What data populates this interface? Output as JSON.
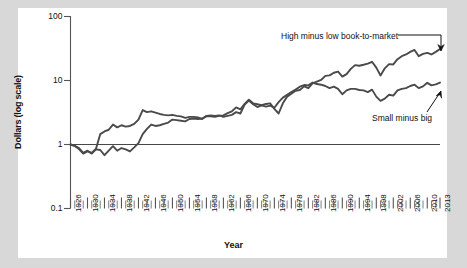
{
  "chart_data": {
    "type": "line",
    "title": "",
    "xlabel": "Year",
    "ylabel": "Dollars (log scale)",
    "log_y": true,
    "ylim": [
      0.1,
      100
    ],
    "ytick_labels": [
      "100",
      "10",
      "1",
      "0.1"
    ],
    "ytick_values": [
      100,
      10,
      1,
      0.1
    ],
    "xlim": [
      1926,
      2013
    ],
    "grid": false,
    "legend_position": "inline-annotations",
    "reference_line_y": 1,
    "xtick_labels": [
      "1926",
      "1930",
      "1934",
      "1938",
      "1942",
      "1946",
      "1950",
      "1954",
      "1958",
      "1962",
      "1966",
      "1970",
      "1974",
      "1978",
      "1982",
      "1986",
      "1990",
      "1994",
      "1998",
      "2002",
      "2006",
      "2010",
      "2013"
    ],
    "xtick_values": [
      1926,
      1930,
      1934,
      1938,
      1942,
      1946,
      1950,
      1954,
      1958,
      1962,
      1966,
      1970,
      1974,
      1978,
      1982,
      1986,
      1990,
      1994,
      1998,
      2002,
      2006,
      2010,
      2013
    ],
    "minor_tick_interval": 1,
    "series": [
      {
        "name": "High minus low book-to-market",
        "color": "#4a4a4a",
        "x": [
          1926,
          1927,
          1928,
          1929,
          1930,
          1931,
          1932,
          1933,
          1934,
          1935,
          1936,
          1937,
          1938,
          1939,
          1940,
          1941,
          1942,
          1943,
          1944,
          1945,
          1946,
          1947,
          1948,
          1949,
          1950,
          1951,
          1952,
          1953,
          1954,
          1955,
          1956,
          1957,
          1958,
          1959,
          1960,
          1961,
          1962,
          1963,
          1964,
          1965,
          1966,
          1967,
          1968,
          1969,
          1970,
          1971,
          1972,
          1973,
          1974,
          1975,
          1976,
          1977,
          1978,
          1979,
          1980,
          1981,
          1982,
          1983,
          1984,
          1985,
          1986,
          1987,
          1988,
          1989,
          1990,
          1991,
          1992,
          1993,
          1994,
          1995,
          1996,
          1997,
          1998,
          1999,
          2000,
          2001,
          2002,
          2003,
          2004,
          2005,
          2006,
          2007,
          2008,
          2009,
          2010,
          2011,
          2012,
          2013
        ],
        "y": [
          1.0,
          0.95,
          0.88,
          0.74,
          0.8,
          0.72,
          0.84,
          0.82,
          0.68,
          0.8,
          0.94,
          0.8,
          0.88,
          0.84,
          0.78,
          0.9,
          1.05,
          1.45,
          1.75,
          2.05,
          1.95,
          2.0,
          2.1,
          2.2,
          2.45,
          2.4,
          2.35,
          2.3,
          2.5,
          2.55,
          2.5,
          2.55,
          2.75,
          2.75,
          2.7,
          2.8,
          2.85,
          3.1,
          3.3,
          3.8,
          3.55,
          4.3,
          5.0,
          4.4,
          4.25,
          4.1,
          4.3,
          4.4,
          3.6,
          3.05,
          4.4,
          5.6,
          6.2,
          6.9,
          7.1,
          8.1,
          7.6,
          9.0,
          9.6,
          10.2,
          11.8,
          12.0,
          13.2,
          13.8,
          11.5,
          12.6,
          15.2,
          17.4,
          17.0,
          17.6,
          18.3,
          19.6,
          15.9,
          12.0,
          15.5,
          18.0,
          17.8,
          21.5,
          24.0,
          25.5,
          28.0,
          30.0,
          24.0,
          26.0,
          27.0,
          25.5,
          28.0,
          31.0
        ]
      },
      {
        "name": "Small minus big",
        "color": "#4a4a4a",
        "x": [
          1926,
          1927,
          1928,
          1929,
          1930,
          1931,
          1932,
          1933,
          1934,
          1935,
          1936,
          1937,
          1938,
          1939,
          1940,
          1941,
          1942,
          1943,
          1944,
          1945,
          1946,
          1947,
          1948,
          1949,
          1950,
          1951,
          1952,
          1953,
          1954,
          1955,
          1956,
          1957,
          1958,
          1959,
          1960,
          1961,
          1962,
          1963,
          1964,
          1965,
          1966,
          1967,
          1968,
          1969,
          1970,
          1971,
          1972,
          1973,
          1974,
          1975,
          1976,
          1977,
          1978,
          1979,
          1980,
          1981,
          1982,
          1983,
          1984,
          1985,
          1986,
          1987,
          1988,
          1989,
          1990,
          1991,
          1992,
          1993,
          1994,
          1995,
          1996,
          1997,
          1998,
          1999,
          2000,
          2001,
          2002,
          2003,
          2004,
          2005,
          2006,
          2007,
          2008,
          2009,
          2010,
          2011,
          2012,
          2013
        ],
        "y": [
          1.0,
          0.95,
          0.85,
          0.72,
          0.78,
          0.74,
          0.86,
          1.45,
          1.6,
          1.7,
          2.05,
          1.85,
          2.0,
          1.9,
          1.95,
          2.1,
          2.45,
          3.45,
          3.2,
          3.3,
          3.15,
          3.0,
          2.9,
          2.85,
          2.9,
          2.8,
          2.75,
          2.6,
          2.7,
          2.7,
          2.65,
          2.5,
          2.8,
          2.85,
          2.8,
          2.85,
          2.7,
          2.8,
          2.9,
          3.2,
          3.05,
          4.2,
          4.85,
          4.25,
          3.85,
          4.1,
          3.9,
          4.05,
          3.75,
          4.6,
          5.4,
          6.0,
          6.6,
          7.2,
          8.0,
          8.5,
          8.4,
          9.3,
          8.8,
          8.6,
          8.2,
          7.6,
          8.0,
          7.4,
          6.1,
          7.0,
          7.4,
          7.4,
          7.1,
          7.0,
          6.6,
          7.2,
          5.6,
          4.8,
          5.2,
          6.0,
          5.8,
          7.0,
          7.4,
          7.6,
          8.2,
          8.6,
          7.6,
          8.1,
          9.2,
          8.4,
          8.7,
          9.3
        ]
      }
    ],
    "annotations": [
      {
        "text": "High minus low book-to-market",
        "target_series": "High minus low book-to-market"
      },
      {
        "text": "Small minus big",
        "target_series": "Small minus big"
      }
    ]
  }
}
